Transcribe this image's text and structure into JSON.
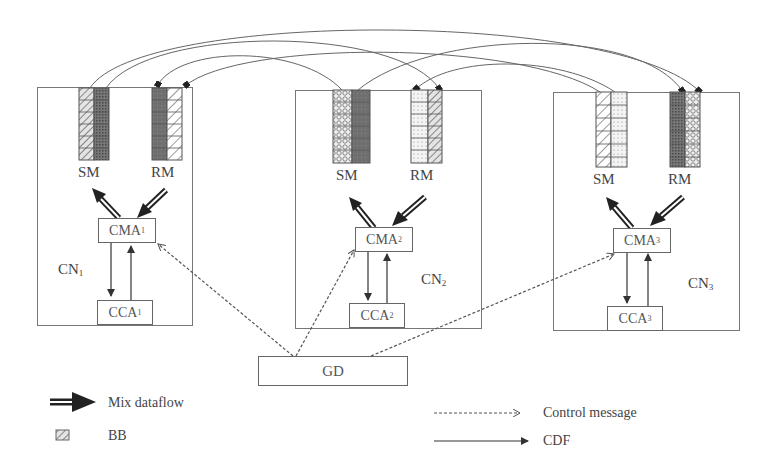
{
  "diagram": {
    "nodes": [
      {
        "id": "cn1",
        "label": "CN",
        "sub": "1",
        "sm_label": "SM",
        "rm_label": "RM",
        "cma": {
          "label": "CMA",
          "sub": "1"
        },
        "cca": {
          "label": "CCA",
          "sub": "1"
        }
      },
      {
        "id": "cn2",
        "label": "CN",
        "sub": "2",
        "sm_label": "SM",
        "rm_label": "RM",
        "cma": {
          "label": "CMA",
          "sub": "2"
        },
        "cca": {
          "label": "CCA",
          "sub": "2"
        }
      },
      {
        "id": "cn3",
        "label": "CN",
        "sub": "3",
        "sm_label": "SM",
        "rm_label": "RM",
        "cma": {
          "label": "CMA",
          "sub": "3"
        },
        "cca": {
          "label": "CCA",
          "sub": "3"
        }
      }
    ],
    "gd": {
      "label": "GD"
    },
    "edges": {
      "control_messages": [
        {
          "from": "GD",
          "to": "CMA1"
        },
        {
          "from": "GD",
          "to": "CMA2"
        },
        {
          "from": "GD",
          "to": "CMA3"
        }
      ],
      "cdf": [
        {
          "from": "CMA1",
          "to": "CCA1"
        },
        {
          "from": "CCA1",
          "to": "CMA1"
        },
        {
          "from": "CMA2",
          "to": "CCA2"
        },
        {
          "from": "CCA2",
          "to": "CMA2"
        },
        {
          "from": "CMA3",
          "to": "CCA3"
        },
        {
          "from": "CCA3",
          "to": "CMA3"
        }
      ],
      "mix_dataflow": [
        {
          "from": "CMA1",
          "to": "SM1"
        },
        {
          "from": "RM1",
          "to": "CMA1"
        },
        {
          "from": "CMA2",
          "to": "SM2"
        },
        {
          "from": "RM2",
          "to": "CMA2"
        },
        {
          "from": "CMA3",
          "to": "SM3"
        },
        {
          "from": "RM3",
          "to": "CMA3"
        }
      ],
      "buffer_transfers": [
        {
          "from": "SM1",
          "to": "RM3"
        },
        {
          "from": "SM1",
          "to": "RM2"
        },
        {
          "from": "SM2",
          "to": "RM1"
        },
        {
          "from": "SM2",
          "to": "RM3"
        },
        {
          "from": "SM3",
          "to": "RM1"
        },
        {
          "from": "SM3",
          "to": "RM2"
        }
      ]
    }
  },
  "legend": {
    "mix_dataflow": "Mix dataflow",
    "bb": "BB",
    "control_message": "Control message",
    "cdf": "CDF"
  },
  "colors": {
    "line": "#555555",
    "dark_fill": "#6a6a6a",
    "hatch": "#777777",
    "box_border": "#666666"
  }
}
